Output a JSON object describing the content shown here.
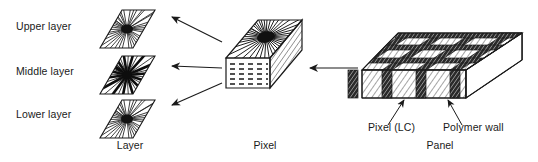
{
  "figure": {
    "background_color": "#ffffff",
    "ink_color": "#1a1a1a"
  },
  "layer_section": {
    "caption": "Layer",
    "items": [
      {
        "label": "Upper layer",
        "pattern": "radial-thin-spokes"
      },
      {
        "label": "Middle layer",
        "pattern": "radial-bold-spokes"
      },
      {
        "label": "Lower layer",
        "pattern": "radial-thin-spokes"
      }
    ]
  },
  "pixel_section": {
    "caption": "Pixel",
    "top_face_pattern": "radial-spokes",
    "front_face_pattern": "dashed-rows"
  },
  "panel_section": {
    "caption": "Panel",
    "annotations": [
      {
        "label": "Pixel (LC)"
      },
      {
        "label": "Polymer wall"
      }
    ],
    "body_pattern": "diagonal-hatch",
    "wall_pattern": "dark-diagonal-hatch"
  }
}
